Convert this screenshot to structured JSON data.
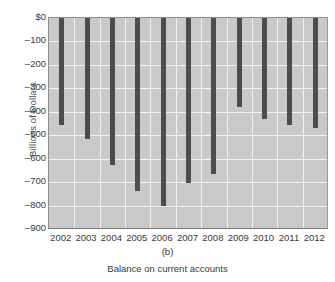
{
  "chart_data": {
    "type": "bar",
    "title": "",
    "subtitle": "",
    "panel_letter": "(b)",
    "caption": "Balance on current accounts",
    "xlabel": "",
    "ylabel": "Billions of Dollars",
    "categories": [
      "2002",
      "2003",
      "2004",
      "2005",
      "2006",
      "2007",
      "2008",
      "2009",
      "2010",
      "2011",
      "2012"
    ],
    "values": [
      -457,
      -517,
      -625,
      -740,
      -800,
      -705,
      -665,
      -378,
      -432,
      -457,
      -470
    ],
    "ylim": [
      -900,
      0
    ],
    "ytick_values": [
      0,
      -100,
      -200,
      -300,
      -400,
      -500,
      -600,
      -700,
      -800,
      -900
    ],
    "ytick_labels": [
      "$0",
      "–100",
      "–200",
      "–300",
      "–400",
      "–500",
      "–600",
      "–700",
      "–800",
      "–900"
    ],
    "grid": true,
    "legend": false,
    "orientation": "vertical",
    "series": [
      {
        "name": "Balance on current accounts",
        "values": [
          -457,
          -517,
          -625,
          -740,
          -800,
          -705,
          -665,
          -378,
          -432,
          -457,
          -470
        ]
      }
    ],
    "colors": {
      "bar": "#4c4c4c",
      "plot_background": "#c9c9c9",
      "gridline": "#f2f2f2",
      "axis": "#8d8d8d",
      "text": "#3a3a3a",
      "figure_background": "#ffffff"
    }
  }
}
